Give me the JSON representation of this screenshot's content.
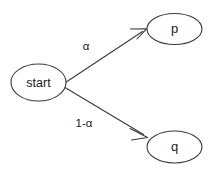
{
  "diagram": {
    "background_color": "#ffffff",
    "stroke_color": "#3a3a3a",
    "text_color": "#1a1a1a",
    "nodes": [
      {
        "id": "start",
        "label": "start",
        "shape": "ellipse",
        "cx": 38.5,
        "cy": 82.5,
        "rx": 27.5,
        "ry": 18.5
      },
      {
        "id": "p",
        "label": "p",
        "shape": "ellipse",
        "cx": 174.5,
        "cy": 29.0,
        "rx": 27.5,
        "ry": 15.5
      },
      {
        "id": "q",
        "label": "q",
        "shape": "ellipse",
        "cx": 174.5,
        "cy": 147.0,
        "rx": 27.5,
        "ry": 16.0
      }
    ],
    "edges": [
      {
        "id": "start-to-p",
        "from": "start",
        "to": "p",
        "label": "α",
        "label_x": 86,
        "label_y": 47,
        "x1": 62.5,
        "y1": 84.5,
        "x2": 146.0,
        "y2": 29.5,
        "arrow": "open-v"
      },
      {
        "id": "start-to-q",
        "from": "start",
        "to": "q",
        "label": "1-α",
        "label_x": 84,
        "label_y": 124,
        "x1": 62.5,
        "y1": 86.0,
        "x2": 147.0,
        "y2": 137.0,
        "arrow": "open-v"
      }
    ]
  }
}
